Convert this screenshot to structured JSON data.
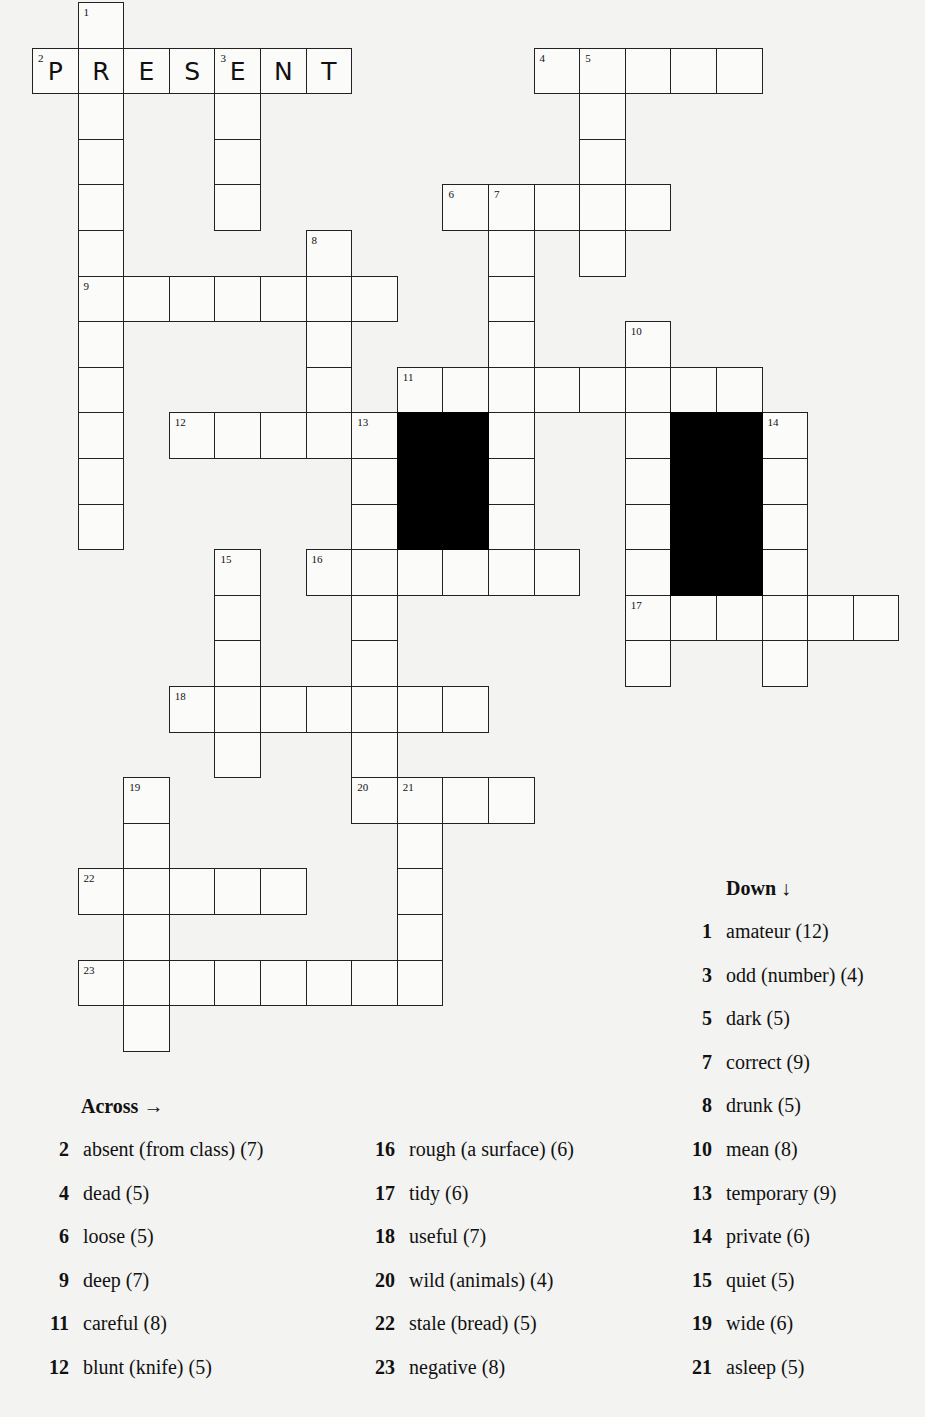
{
  "puzzle": {
    "grid_origin": {
      "x": 32,
      "y": 2
    },
    "cell_size": 45.6,
    "words": [
      {
        "num": 1,
        "dir": "down",
        "row": 0,
        "col": 1,
        "len": 12
      },
      {
        "num": 2,
        "dir": "across",
        "row": 1,
        "col": 0,
        "len": 7,
        "filled": "PRESENT"
      },
      {
        "num": 3,
        "dir": "down",
        "row": 1,
        "col": 4,
        "len": 4
      },
      {
        "num": 4,
        "dir": "across",
        "row": 1,
        "col": 11,
        "len": 5
      },
      {
        "num": 5,
        "dir": "down",
        "row": 1,
        "col": 12,
        "len": 5
      },
      {
        "num": 6,
        "dir": "across",
        "row": 4,
        "col": 9,
        "len": 5
      },
      {
        "num": 7,
        "dir": "down",
        "row": 4,
        "col": 10,
        "len": 9
      },
      {
        "num": 8,
        "dir": "down",
        "row": 5,
        "col": 6,
        "len": 5
      },
      {
        "num": 9,
        "dir": "across",
        "row": 6,
        "col": 1,
        "len": 7
      },
      {
        "num": 10,
        "dir": "down",
        "row": 7,
        "col": 13,
        "len": 8
      },
      {
        "num": 11,
        "dir": "across",
        "row": 8,
        "col": 8,
        "len": 8
      },
      {
        "num": 12,
        "dir": "across",
        "row": 9,
        "col": 3,
        "len": 5
      },
      {
        "num": 13,
        "dir": "down",
        "row": 9,
        "col": 7,
        "len": 9
      },
      {
        "num": 14,
        "dir": "down",
        "row": 9,
        "col": 16,
        "len": 6
      },
      {
        "num": 15,
        "dir": "down",
        "row": 12,
        "col": 4,
        "len": 5
      },
      {
        "num": 16,
        "dir": "across",
        "row": 12,
        "col": 6,
        "len": 6
      },
      {
        "num": 17,
        "dir": "across",
        "row": 13,
        "col": 13,
        "len": 6
      },
      {
        "num": 18,
        "dir": "across",
        "row": 15,
        "col": 3,
        "len": 7
      },
      {
        "num": 19,
        "dir": "down",
        "row": 17,
        "col": 2,
        "len": 6
      },
      {
        "num": 20,
        "dir": "across",
        "row": 17,
        "col": 7,
        "len": 4
      },
      {
        "num": 21,
        "dir": "down",
        "row": 17,
        "col": 8,
        "len": 5
      },
      {
        "num": 22,
        "dir": "across",
        "row": 19,
        "col": 1,
        "len": 5
      },
      {
        "num": 23,
        "dir": "across",
        "row": 21,
        "col": 1,
        "len": 8
      }
    ],
    "black_blocks": [
      {
        "row": 9,
        "col": 8,
        "rows": 3,
        "cols": 2
      },
      {
        "row": 9,
        "col": 14,
        "rows": 4,
        "cols": 2
      }
    ]
  },
  "clues": {
    "across_heading": "Across →",
    "down_heading": "Down ↓",
    "across": [
      {
        "num": "2",
        "text": "absent (from class) (7)"
      },
      {
        "num": "4",
        "text": "dead (5)"
      },
      {
        "num": "6",
        "text": "loose (5)"
      },
      {
        "num": "9",
        "text": "deep (7)"
      },
      {
        "num": "11",
        "text": "careful (8)"
      },
      {
        "num": "12",
        "text": "blunt (knife) (5)"
      },
      {
        "num": "16",
        "text": "rough (a surface) (6)"
      },
      {
        "num": "17",
        "text": "tidy (6)"
      },
      {
        "num": "18",
        "text": "useful (7)"
      },
      {
        "num": "20",
        "text": "wild (animals) (4)"
      },
      {
        "num": "22",
        "text": "stale (bread) (5)"
      },
      {
        "num": "23",
        "text": "negative (8)"
      }
    ],
    "down": [
      {
        "num": "1",
        "text": "amateur (12)"
      },
      {
        "num": "3",
        "text": "odd (number) (4)"
      },
      {
        "num": "5",
        "text": "dark (5)"
      },
      {
        "num": "7",
        "text": "correct (9)"
      },
      {
        "num": "8",
        "text": "drunk (5)"
      },
      {
        "num": "10",
        "text": "mean (8)"
      },
      {
        "num": "13",
        "text": "temporary (9)"
      },
      {
        "num": "14",
        "text": "private (6)"
      },
      {
        "num": "15",
        "text": "quiet (5)"
      },
      {
        "num": "19",
        "text": "wide (6)"
      },
      {
        "num": "21",
        "text": "asleep (5)"
      }
    ]
  }
}
